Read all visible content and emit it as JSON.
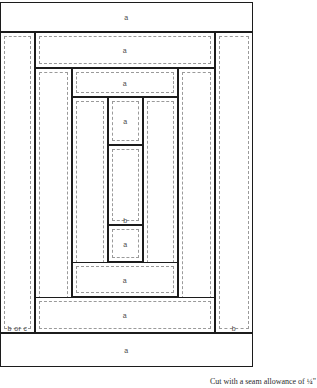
{
  "figure": {
    "kind": "quilt-log-cabin-block-cutting-diagram",
    "caption": "Cut with a seam allowance of ¼\"",
    "colors": {
      "cut_line": "#1c1c1c",
      "seam_line": "#9a9a9a",
      "fabric": "#ffffff",
      "label": "#4a4a4a"
    },
    "labels": {
      "a": "a",
      "b": "b",
      "b_or_c": "b or c"
    }
  },
  "pieces": [
    {
      "id": "top-a-1",
      "label": "a",
      "x": 0,
      "y": 2,
      "w": 253,
      "h": 30,
      "orient": "h",
      "ring": 1,
      "dashed": false
    },
    {
      "id": "left-boc-1",
      "label": "b or c",
      "x": 0,
      "y": 32,
      "w": 35,
      "h": 301,
      "orient": "v",
      "ring": 1,
      "dashed": true
    },
    {
      "id": "right-b-1",
      "label": "b",
      "x": 215,
      "y": 32,
      "w": 38,
      "h": 301,
      "orient": "v",
      "ring": 1,
      "dashed": true
    },
    {
      "id": "bottom-a-1",
      "label": "a",
      "x": 0,
      "y": 333,
      "w": 253,
      "h": 34,
      "orient": "h",
      "ring": 1,
      "dashed": false
    },
    {
      "id": "top-a-2",
      "label": "a",
      "x": 35,
      "y": 32,
      "w": 180,
      "h": 36,
      "orient": "h",
      "ring": 2,
      "dashed": true
    },
    {
      "id": "left-boc-2",
      "label": "b or c",
      "x": 35,
      "y": 68,
      "w": 37,
      "h": 265,
      "orient": "v",
      "ring": 2,
      "dashed": true
    },
    {
      "id": "right-b-2",
      "label": "b",
      "x": 178,
      "y": 68,
      "w": 37,
      "h": 265,
      "orient": "v",
      "ring": 2,
      "dashed": true
    },
    {
      "id": "bottom-a-2",
      "label": "a",
      "x": 35,
      "y": 297,
      "w": 180,
      "h": 36,
      "orient": "h",
      "ring": 2,
      "dashed": true
    },
    {
      "id": "top-a-3",
      "label": "a",
      "x": 72,
      "y": 68,
      "w": 106,
      "h": 29,
      "orient": "h",
      "ring": 3,
      "dashed": true
    },
    {
      "id": "left-boc-3",
      "label": "b or c",
      "x": 72,
      "y": 97,
      "w": 36,
      "h": 200,
      "orient": "v",
      "ring": 3,
      "dashed": true
    },
    {
      "id": "right-b-3",
      "label": "b",
      "x": 143,
      "y": 97,
      "w": 35,
      "h": 200,
      "orient": "v",
      "ring": 3,
      "dashed": true
    },
    {
      "id": "bottom-a-3",
      "label": "a",
      "x": 72,
      "y": 262,
      "w": 106,
      "h": 35,
      "orient": "h",
      "ring": 3,
      "dashed": true
    },
    {
      "id": "top-a-4",
      "label": "a",
      "x": 108,
      "y": 97,
      "w": 35,
      "h": 48,
      "orient": "h",
      "ring": 4,
      "dashed": true
    },
    {
      "id": "center-b",
      "label": "b",
      "x": 108,
      "y": 145,
      "w": 35,
      "h": 80,
      "orient": "v",
      "ring": 4,
      "dashed": true
    },
    {
      "id": "bottom-a-4",
      "label": "a",
      "x": 108,
      "y": 225,
      "w": 35,
      "h": 37,
      "orient": "h",
      "ring": 4,
      "dashed": true
    }
  ]
}
